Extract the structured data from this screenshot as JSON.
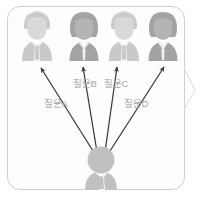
{
  "diagram": {
    "frame": {
      "shape": "rounded-rectangle",
      "border_color": "#cfcfcf",
      "background": "#fdfdfd"
    },
    "colors": {
      "male_figure": "#c9c9c9",
      "female_figure": "#a3a3a3",
      "asker_figure": "#c0c0c0",
      "arrow": "#3a3a3a",
      "label_text": "#a8a8a8",
      "frame_border": "#cfcfcf"
    },
    "respondents": [
      {
        "id": "respondent-1",
        "gender": "male",
        "icon": "person-male-icon",
        "color": "#c9c9c9",
        "x": 37,
        "y": 40
      },
      {
        "id": "respondent-2",
        "gender": "female",
        "icon": "person-female-icon",
        "color": "#a3a3a3",
        "x": 84,
        "y": 40
      },
      {
        "id": "respondent-3",
        "gender": "male",
        "icon": "person-male-icon",
        "color": "#c9c9c9",
        "x": 124,
        "y": 40
      },
      {
        "id": "respondent-4",
        "gender": "female",
        "icon": "person-female-icon",
        "color": "#a3a3a3",
        "x": 163,
        "y": 40
      }
    ],
    "asker": {
      "id": "asker",
      "gender": "male",
      "icon": "person-male-icon",
      "color": "#c0c0c0",
      "x": 101,
      "y": 170
    },
    "arrows": [
      {
        "id": "arrow-a",
        "label": "질문A",
        "from": "asker",
        "to": "respondent-1"
      },
      {
        "id": "arrow-b",
        "label": "질문B",
        "from": "asker",
        "to": "respondent-2"
      },
      {
        "id": "arrow-c",
        "label": "질문C",
        "from": "asker",
        "to": "respondent-3"
      },
      {
        "id": "arrow-d",
        "label": "질문D",
        "from": "asker",
        "to": "respondent-4"
      }
    ],
    "labels": {
      "a": "질문A",
      "b": "질문B",
      "c": "질문C",
      "d": "질문D"
    }
  }
}
